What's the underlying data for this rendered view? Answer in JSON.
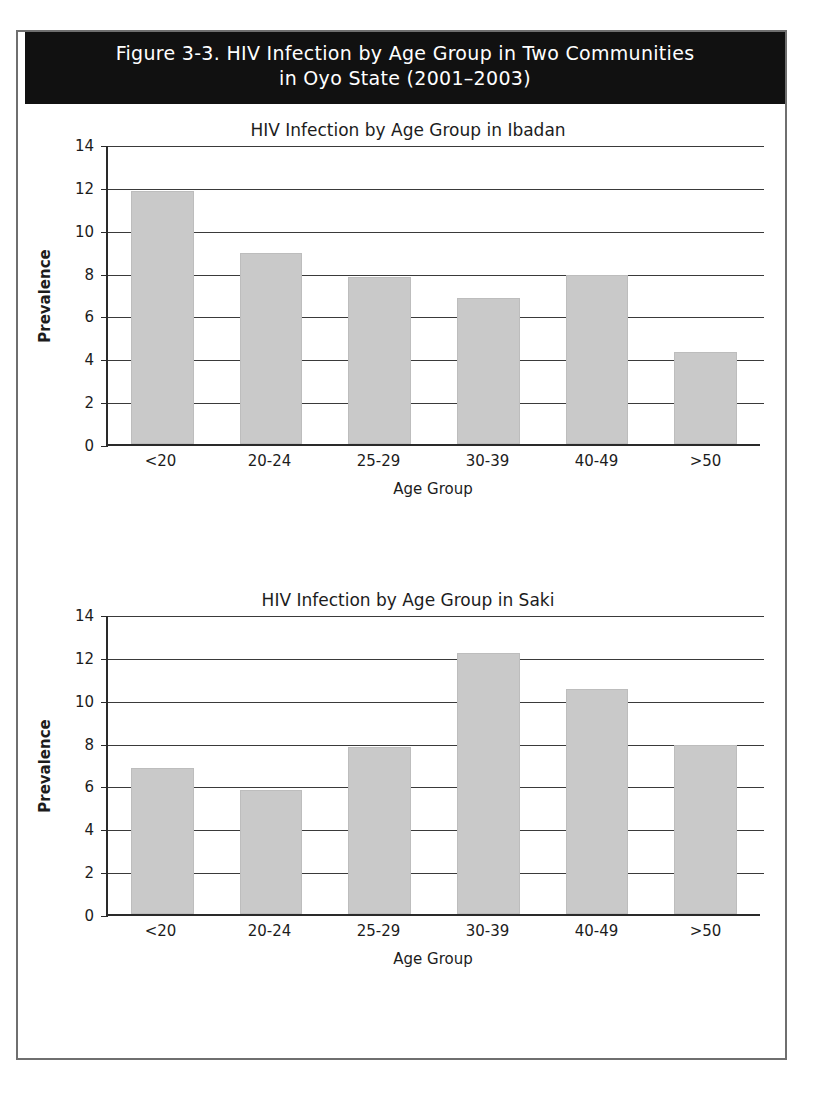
{
  "figure": {
    "banner_title": "Figure 3-3. HIV Infection by Age Group in Two Communities\nin Oyo State (2001–2003)",
    "banner_bg": "#111111",
    "banner_fg": "#ffffff",
    "frame_color": "#6f6f6f",
    "bar_color": "#c9c9c9",
    "axis_color": "#2a2a2a"
  },
  "chart_data": [
    {
      "type": "bar",
      "id": "ibadan",
      "title": "HIV Infection by Age Group in Ibadan",
      "xlabel": "Age Group",
      "ylabel": "Prevalence",
      "categories": [
        "<20",
        "20-24",
        "25-29",
        "30-39",
        "40-49",
        ">50"
      ],
      "values": [
        11.8,
        8.9,
        7.8,
        6.8,
        7.9,
        4.3
      ],
      "ylim": [
        0,
        14
      ],
      "yticks": [
        0,
        2,
        4,
        6,
        8,
        10,
        12,
        14
      ],
      "grid": true,
      "legend": "none"
    },
    {
      "type": "bar",
      "id": "saki",
      "title": "HIV Infection by Age Group in Saki",
      "xlabel": "Age Group",
      "ylabel": "Prevalence",
      "categories": [
        "<20",
        "20-24",
        "25-29",
        "30-39",
        "40-49",
        ">50"
      ],
      "values": [
        6.8,
        5.8,
        7.8,
        12.2,
        10.5,
        7.9
      ],
      "ylim": [
        0,
        14
      ],
      "yticks": [
        0,
        2,
        4,
        6,
        8,
        10,
        12,
        14
      ],
      "grid": true,
      "legend": "none"
    }
  ]
}
